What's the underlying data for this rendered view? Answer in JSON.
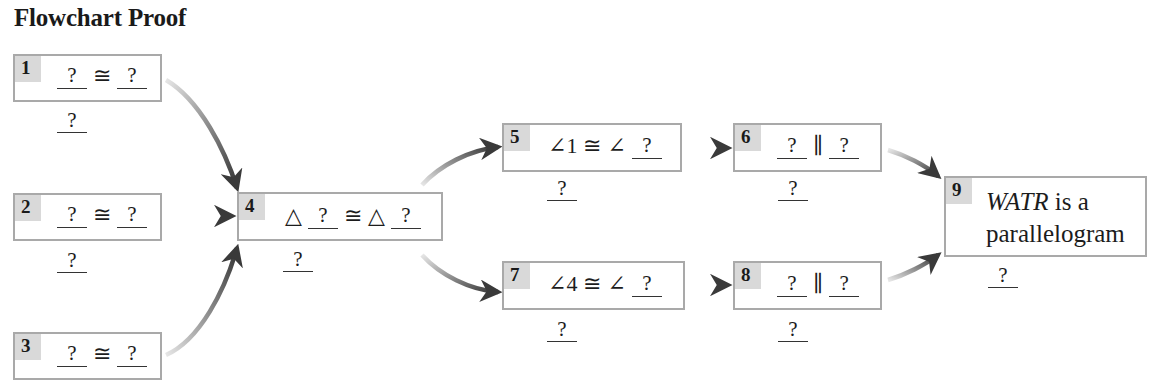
{
  "title": "Flowchart Proof",
  "colors": {
    "box_border": "#a9a9a9",
    "number_badge": "#d9d9d9",
    "arrow": "#3a3a3a",
    "text": "#1c1c1c"
  },
  "blank": "?",
  "symbols": {
    "congruent": "≅",
    "parallel": "∥",
    "triangle": "△",
    "angle": "∠"
  },
  "steps": [
    {
      "number": "1",
      "statement": [
        "?",
        "≅",
        "?"
      ],
      "reason": "?"
    },
    {
      "number": "2",
      "statement": [
        "?",
        "≅",
        "?"
      ],
      "reason": "?"
    },
    {
      "number": "3",
      "statement": [
        "?",
        "≅",
        "?"
      ],
      "reason": null
    },
    {
      "number": "4",
      "statement": [
        "△",
        "?",
        "≅",
        "△",
        "?"
      ],
      "reason": "?"
    },
    {
      "number": "5",
      "statement": [
        "∠1",
        "≅",
        "∠",
        "?"
      ],
      "reason": "?"
    },
    {
      "number": "6",
      "statement": [
        "?",
        "∥",
        "?"
      ],
      "reason": "?"
    },
    {
      "number": "7",
      "statement": [
        "∠4",
        "≅",
        "∠",
        "?"
      ],
      "reason": "?"
    },
    {
      "number": "8",
      "statement": [
        "?",
        "∥",
        "?"
      ],
      "reason": "?"
    },
    {
      "number": "9",
      "statement_italic": "WATR",
      "statement_rest": " is a",
      "statement_line2": "parallelogram",
      "reason": "?"
    }
  ],
  "connections": [
    {
      "from": "1",
      "to": "4"
    },
    {
      "from": "2",
      "to": "4"
    },
    {
      "from": "3",
      "to": "4"
    },
    {
      "from": "4",
      "to": "5"
    },
    {
      "from": "4",
      "to": "7"
    },
    {
      "from": "5",
      "to": "6"
    },
    {
      "from": "7",
      "to": "8"
    },
    {
      "from": "6",
      "to": "9"
    },
    {
      "from": "8",
      "to": "9"
    }
  ]
}
